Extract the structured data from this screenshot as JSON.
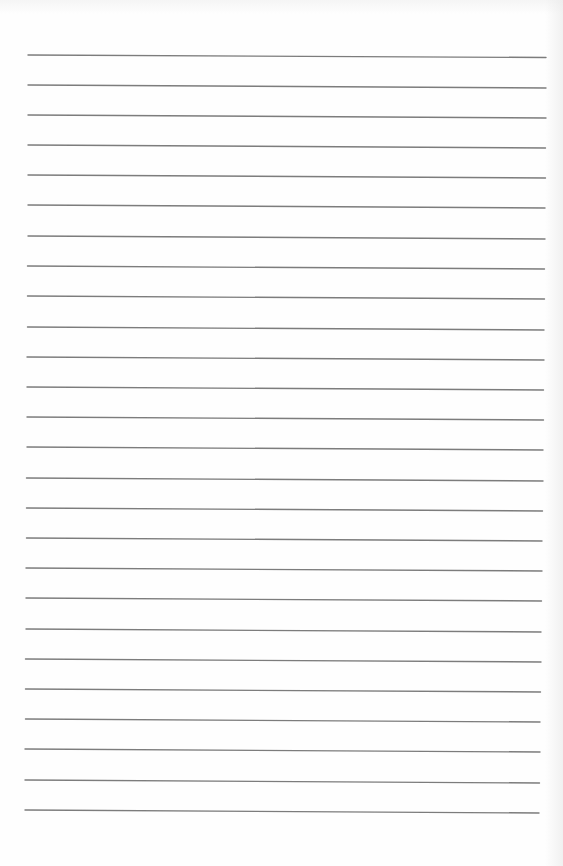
{
  "document": {
    "type": "ruled-paper",
    "line_count": 26,
    "line_color": "#6e6e6e",
    "background_color": "#fefefe",
    "lines": [
      {
        "x1": 28,
        "y1": 55,
        "x2": 546,
        "y2": 57.5
      },
      {
        "x1": 28,
        "y1": 85,
        "x2": 546,
        "y2": 88
      },
      {
        "x1": 28,
        "y1": 115,
        "x2": 546,
        "y2": 118
      },
      {
        "x1": 28,
        "y1": 145,
        "x2": 545.5,
        "y2": 148
      },
      {
        "x1": 28,
        "y1": 175,
        "x2": 545.5,
        "y2": 178
      },
      {
        "x1": 28,
        "y1": 205,
        "x2": 545,
        "y2": 208
      },
      {
        "x1": 28,
        "y1": 236,
        "x2": 545,
        "y2": 239
      },
      {
        "x1": 27.5,
        "y1": 266,
        "x2": 544.5,
        "y2": 269
      },
      {
        "x1": 27.5,
        "y1": 296,
        "x2": 544.5,
        "y2": 299
      },
      {
        "x1": 27.5,
        "y1": 327,
        "x2": 544,
        "y2": 330
      },
      {
        "x1": 27,
        "y1": 357,
        "x2": 544,
        "y2": 360
      },
      {
        "x1": 27,
        "y1": 387,
        "x2": 543.5,
        "y2": 390
      },
      {
        "x1": 27,
        "y1": 417,
        "x2": 543.5,
        "y2": 420
      },
      {
        "x1": 27,
        "y1": 447,
        "x2": 543,
        "y2": 450
      },
      {
        "x1": 26.5,
        "y1": 478,
        "x2": 543,
        "y2": 481
      },
      {
        "x1": 26.5,
        "y1": 508,
        "x2": 542.5,
        "y2": 511
      },
      {
        "x1": 26.5,
        "y1": 538,
        "x2": 542,
        "y2": 541
      },
      {
        "x1": 26,
        "y1": 568,
        "x2": 542,
        "y2": 571
      },
      {
        "x1": 26,
        "y1": 598,
        "x2": 541.5,
        "y2": 601
      },
      {
        "x1": 26,
        "y1": 629,
        "x2": 541,
        "y2": 632
      },
      {
        "x1": 25.5,
        "y1": 659,
        "x2": 541,
        "y2": 662
      },
      {
        "x1": 25.5,
        "y1": 689,
        "x2": 540.5,
        "y2": 692
      },
      {
        "x1": 25.5,
        "y1": 719,
        "x2": 540,
        "y2": 722
      },
      {
        "x1": 25,
        "y1": 749,
        "x2": 540,
        "y2": 752
      },
      {
        "x1": 25,
        "y1": 780,
        "x2": 539.5,
        "y2": 783
      },
      {
        "x1": 25,
        "y1": 810,
        "x2": 539,
        "y2": 813
      }
    ]
  }
}
